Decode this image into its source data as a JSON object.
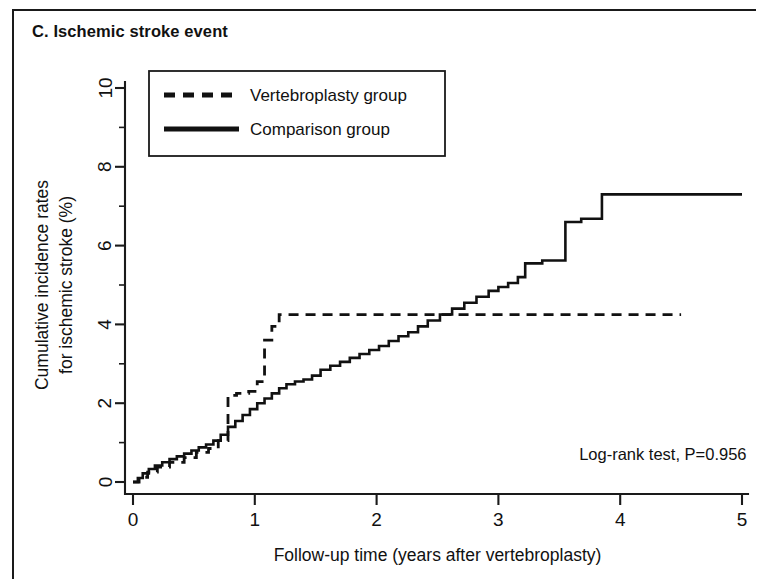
{
  "panel": {
    "title": "C. Ischemic stroke event"
  },
  "annotation": {
    "logrank": "Log-rank test, P=0.956"
  },
  "legend": {
    "items": [
      {
        "label": "Vertebroplasty group",
        "style": "dashed"
      },
      {
        "label": "Comparison group",
        "style": "solid"
      }
    ]
  },
  "chart_data": {
    "type": "line",
    "title": "C. Ischemic stroke event",
    "subtitle": "",
    "xlabel": "Follow-up time (years after vertebroplasty)",
    "ylabel": "Cumulative incidence rates for ischemic stroke (%)",
    "xlim": [
      0,
      5
    ],
    "ylim": [
      0,
      10
    ],
    "xticks": [
      0,
      1,
      2,
      3,
      4,
      5
    ],
    "xticklabels": [
      "0",
      "1",
      "2",
      "3",
      "4",
      "5"
    ],
    "yticks": [
      0,
      2,
      4,
      6,
      8,
      10
    ],
    "yticklabels": [
      "0",
      "2",
      "4",
      "6",
      "8",
      "10"
    ],
    "y_minor_ticks": [
      1,
      3,
      5,
      7,
      9
    ],
    "grid": false,
    "legend_position": "upper left",
    "annotations": [
      {
        "text": "Log-rank test, P=0.956",
        "x": 4.35,
        "y": 0.55
      }
    ],
    "series": [
      {
        "name": "Vertebroplasty group",
        "style": "dashed",
        "step": "post",
        "x": [
          0.0,
          0.05,
          0.12,
          0.2,
          0.3,
          0.42,
          0.52,
          0.62,
          0.7,
          0.78,
          0.85,
          0.95,
          1.02,
          1.08,
          1.14,
          1.2,
          4.5
        ],
        "y": [
          0.0,
          0.12,
          0.25,
          0.38,
          0.5,
          0.62,
          0.75,
          0.85,
          1.05,
          2.2,
          2.25,
          2.3,
          2.55,
          3.6,
          3.95,
          4.25,
          4.25
        ]
      },
      {
        "name": "Comparison group",
        "style": "solid",
        "step": "post",
        "x": [
          0.0,
          0.04,
          0.08,
          0.13,
          0.18,
          0.24,
          0.3,
          0.36,
          0.42,
          0.48,
          0.54,
          0.6,
          0.66,
          0.72,
          0.78,
          0.84,
          0.9,
          0.96,
          1.02,
          1.08,
          1.14,
          1.2,
          1.26,
          1.33,
          1.4,
          1.47,
          1.54,
          1.62,
          1.7,
          1.78,
          1.86,
          1.94,
          2.02,
          2.1,
          2.18,
          2.26,
          2.34,
          2.42,
          2.52,
          2.62,
          2.72,
          2.82,
          2.92,
          3.0,
          3.08,
          3.16,
          3.22,
          3.36,
          3.55,
          3.68,
          3.85,
          5.0
        ],
        "y": [
          0.0,
          0.1,
          0.22,
          0.33,
          0.42,
          0.5,
          0.58,
          0.65,
          0.72,
          0.8,
          0.88,
          0.95,
          1.05,
          1.2,
          1.4,
          1.55,
          1.7,
          1.85,
          2.0,
          2.12,
          2.25,
          2.38,
          2.48,
          2.55,
          2.6,
          2.7,
          2.85,
          2.95,
          3.05,
          3.15,
          3.25,
          3.35,
          3.45,
          3.58,
          3.7,
          3.8,
          3.95,
          4.1,
          4.25,
          4.4,
          4.55,
          4.7,
          4.85,
          4.95,
          5.05,
          5.2,
          5.55,
          5.62,
          6.6,
          6.68,
          7.3,
          7.3
        ]
      }
    ]
  }
}
